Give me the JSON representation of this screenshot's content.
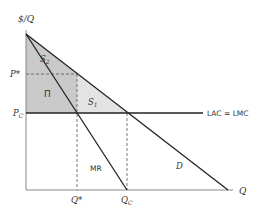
{
  "header": {
    "cut_off_text": ""
  },
  "axes": {
    "y_label": "$/Q",
    "x_label": "Q"
  },
  "price_labels": {
    "p_star": "P*",
    "p_c_main": "P",
    "p_c_sub": "C"
  },
  "quantity_labels": {
    "q_star": "Q*",
    "q_c_main": "Q",
    "q_c_sub": "C"
  },
  "curves": {
    "demand": "D",
    "marginal_revenue": "MR",
    "cost": "LAC = LMC"
  },
  "regions": {
    "s2_main": "S",
    "s2_sub": "2",
    "s1_main": "S",
    "s1_sub": "1",
    "profit": "Π"
  },
  "colors": {
    "dark_shade": "#c9c9c9",
    "light_shade": "#e3e3e3",
    "line": "#222222",
    "dashed": "#555555"
  }
}
